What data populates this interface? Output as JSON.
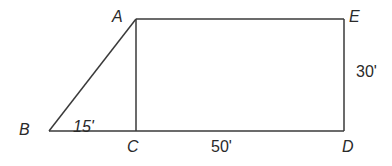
{
  "figure": {
    "stroke_color": "#3a3a3a",
    "text_color": "#2a2a2a",
    "background": "#ffffff",
    "points": {
      "A": {
        "label": "A",
        "x": 136,
        "y": 19
      },
      "B": {
        "label": "B",
        "x": 49,
        "y": 131
      },
      "C": {
        "label": "C",
        "x": 136,
        "y": 131
      },
      "D": {
        "label": "D",
        "x": 344,
        "y": 131
      },
      "E": {
        "label": "E",
        "x": 344,
        "y": 19
      }
    },
    "segments": [
      {
        "from": "B",
        "to": "A"
      },
      {
        "from": "A",
        "to": "E"
      },
      {
        "from": "E",
        "to": "D"
      },
      {
        "from": "D",
        "to": "B"
      },
      {
        "from": "A",
        "to": "C"
      }
    ],
    "measurements": {
      "BC": "15'",
      "CD": "50'",
      "ED": "30'"
    }
  }
}
